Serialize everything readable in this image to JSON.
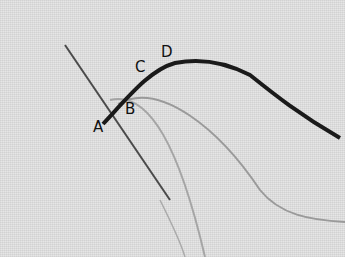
{
  "image": {
    "description": "Embroidery demonstration: needle passing through fabric with stitched thread",
    "labels": [
      {
        "id": "A",
        "text": "A",
        "x": 93,
        "y": 120
      },
      {
        "id": "B",
        "text": "B",
        "x": 125,
        "y": 102
      },
      {
        "id": "C",
        "text": "C",
        "x": 135,
        "y": 60
      },
      {
        "id": "D",
        "text": "D",
        "x": 161,
        "y": 45
      }
    ],
    "colors": {
      "fabric": "#e6e6e6",
      "thread_dark": "#1a1a1a",
      "thread_light": "#9a9a9a",
      "needle": "#555555"
    }
  }
}
